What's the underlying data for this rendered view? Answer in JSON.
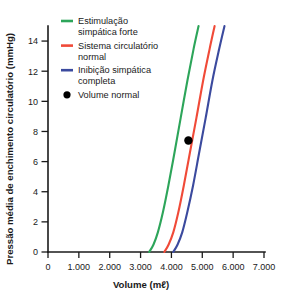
{
  "chart_data": {
    "type": "line",
    "title": "",
    "xlabel": "Volume (mℓ)",
    "ylabel": "Pressão média de enchimento circulatório (mmHg)",
    "xlim": [
      0,
      7000
    ],
    "ylim": [
      0,
      15
    ],
    "grid": false,
    "legend_position": "top-left",
    "x_ticks": [
      "0",
      "1.000",
      "2.000",
      "3.000",
      "4.000",
      "5.000",
      "6.000",
      "7.000"
    ],
    "x_tick_values": [
      0,
      1000,
      2000,
      3000,
      4000,
      5000,
      6000,
      7000
    ],
    "y_ticks": [
      "0",
      "2",
      "4",
      "6",
      "8",
      "10",
      "12",
      "14"
    ],
    "y_tick_values": [
      0,
      2,
      4,
      6,
      8,
      10,
      12,
      14
    ],
    "series": [
      {
        "name": "Estimulação simpática forte",
        "color": "#2da55a",
        "x": [
          3280,
          3420,
          3560,
          3720,
          3900,
          4100,
          4300,
          4520,
          4720,
          4880
        ],
        "y": [
          0,
          0.5,
          1.3,
          2.6,
          4.4,
          6.6,
          8.9,
          11.4,
          13.5,
          15.0
        ]
      },
      {
        "name": "Sistema circulatório normal",
        "color": "#f04a38",
        "x": [
          3770,
          3910,
          4060,
          4220,
          4400,
          4600,
          4810,
          5030,
          5240,
          5400
        ],
        "y": [
          0,
          0.5,
          1.3,
          2.6,
          4.4,
          6.6,
          8.9,
          11.4,
          13.5,
          15.0
        ]
      },
      {
        "name": "Inibição simpática completa",
        "color": "#3b4a9e",
        "x": [
          4060,
          4200,
          4350,
          4510,
          4700,
          4900,
          5110,
          5330,
          5550,
          5720
        ],
        "y": [
          0,
          0.5,
          1.3,
          2.6,
          4.4,
          6.6,
          8.9,
          11.4,
          13.5,
          15.0
        ]
      }
    ],
    "points": [
      {
        "name": "Volume normal",
        "color": "#000000",
        "x": 4550,
        "y": 7.4
      }
    ]
  },
  "legend": {
    "items": [
      {
        "label_line1": "Estimulação",
        "label_line2": "simpática forte",
        "marker": "line",
        "color": "#2da55a"
      },
      {
        "label_line1": "Sistema circulatório",
        "label_line2": "normal",
        "marker": "line",
        "color": "#f04a38"
      },
      {
        "label_line1": "Inibição simpática",
        "label_line2": "completa",
        "marker": "line",
        "color": "#3b4a9e"
      },
      {
        "label_line1": "Volume normal",
        "label_line2": "",
        "marker": "dot",
        "color": "#000000"
      }
    ]
  }
}
